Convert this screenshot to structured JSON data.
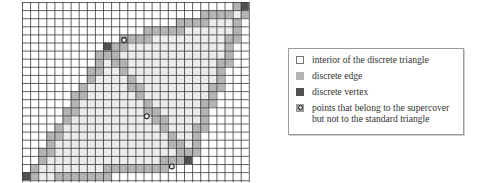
{
  "figure": {
    "grid": {
      "cols": 28,
      "rows": 22,
      "cell_px": 8.1,
      "line_color": "#3a3a3a",
      "vertices": [
        [
          27,
          0
        ],
        [
          10,
          5
        ],
        [
          20,
          19
        ],
        [
          0,
          22
        ]
      ],
      "edges": [
        [
          0,
          1
        ],
        [
          1,
          3
        ],
        [
          3,
          2
        ],
        [
          2,
          0
        ],
        [
          1,
          2
        ]
      ],
      "extra_points": [
        [
          12.6,
          4.7
        ],
        [
          15.4,
          14.1
        ],
        [
          18.5,
          20.3
        ]
      ]
    },
    "colors": {
      "interior": "#ececec",
      "edge": "#b4b4b4",
      "vertex": "#505050",
      "background": "#ffffff"
    }
  },
  "legend": {
    "items": [
      {
        "label": "interior of the discrete triangle",
        "swatch": "interior"
      },
      {
        "label": "discrete edge",
        "swatch": "edge"
      },
      {
        "label": "discrete vertex",
        "swatch": "vertex"
      },
      {
        "label": "points that belong to the supercover\nbut not to the standard triangle",
        "swatch": "point"
      }
    ]
  }
}
